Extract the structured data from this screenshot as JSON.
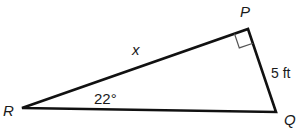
{
  "diagram": {
    "type": "right-triangle",
    "vertices": {
      "R": {
        "label": "R",
        "x": 22,
        "y": 108
      },
      "P": {
        "label": "P",
        "x": 248,
        "y": 29
      },
      "Q": {
        "label": "Q",
        "x": 276,
        "y": 112
      }
    },
    "labels": {
      "hypotenuse_side": "x",
      "angle_R": "22°",
      "side_PQ": "5 ft"
    },
    "right_angle_at": "P",
    "stroke_color": "#111111"
  }
}
